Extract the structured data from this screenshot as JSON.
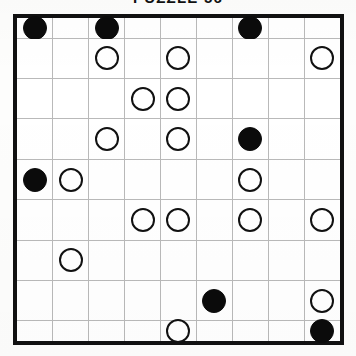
{
  "puzzle": {
    "title": "PUZZLE 56",
    "type": "masyu",
    "rows": 9,
    "cols": 9,
    "legend": {
      "black_pearl": "black-circle",
      "white_pearl": "white-circle",
      "empty": "empty-cell"
    },
    "colors": {
      "border": "#111111",
      "gridline": "#b9b9b9",
      "pearl_black_fill": "#0b0b0b",
      "pearl_white_fill": "#ffffff",
      "pearl_white_stroke": "#111111",
      "background": "#ffffff"
    },
    "grid": [
      [
        "black",
        "empty",
        "black",
        "empty",
        "empty",
        "empty",
        "black",
        "empty",
        "empty"
      ],
      [
        "empty",
        "empty",
        "white",
        "empty",
        "white",
        "empty",
        "empty",
        "empty",
        "white"
      ],
      [
        "empty",
        "empty",
        "empty",
        "white",
        "white",
        "empty",
        "empty",
        "empty",
        "empty"
      ],
      [
        "empty",
        "empty",
        "white",
        "empty",
        "white",
        "empty",
        "black",
        "empty",
        "empty"
      ],
      [
        "black",
        "white",
        "empty",
        "empty",
        "empty",
        "empty",
        "white",
        "empty",
        "empty"
      ],
      [
        "empty",
        "empty",
        "empty",
        "white",
        "white",
        "empty",
        "white",
        "empty",
        "white"
      ],
      [
        "empty",
        "white",
        "empty",
        "empty",
        "empty",
        "empty",
        "empty",
        "empty",
        "empty"
      ],
      [
        "empty",
        "empty",
        "empty",
        "empty",
        "empty",
        "black",
        "empty",
        "empty",
        "white"
      ],
      [
        "empty",
        "empty",
        "empty",
        "empty",
        "white",
        "empty",
        "empty",
        "empty",
        "black"
      ]
    ],
    "counts": {
      "black_pearls": 6,
      "white_pearls": 16,
      "total_cells": 81
    }
  }
}
